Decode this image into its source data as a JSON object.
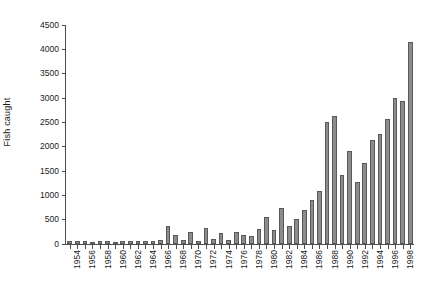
{
  "chart_data": {
    "type": "bar",
    "title": "",
    "xlabel": "",
    "ylabel": "Fish caught",
    "ylim": [
      0,
      4500
    ],
    "ytick_step": 500,
    "grid": false,
    "legend": null,
    "bar_color": "#8c8c8c",
    "bar_edge_color": "#595959",
    "axis_color": "#4d4d4d",
    "text_color": "#1a1a1a",
    "background": "#ffffff",
    "xtick_label_rotation": -90,
    "xtick_label_interval": 2,
    "yticks": [
      0,
      500,
      1000,
      1500,
      2000,
      2500,
      3000,
      3500,
      4000,
      4500
    ],
    "ytick_labels": [
      "0",
      "500",
      "1000",
      "1500",
      "2000",
      "2500",
      "3000",
      "3500",
      "4000",
      "4500"
    ],
    "categories": [
      "1954",
      "1955",
      "1956",
      "1957",
      "1958",
      "1959",
      "1960",
      "1961",
      "1962",
      "1963",
      "1964",
      "1965",
      "1966",
      "1967",
      "1968",
      "1969",
      "1970",
      "1971",
      "1972",
      "1973",
      "1974",
      "1975",
      "1976",
      "1977",
      "1978",
      "1979",
      "1980",
      "1981",
      "1982",
      "1983",
      "1984",
      "1985",
      "1986",
      "1987",
      "1988",
      "1989",
      "1990",
      "1991",
      "1992",
      "1993",
      "1994",
      "1995",
      "1996",
      "1997",
      "1998",
      "1999"
    ],
    "values": [
      60,
      55,
      60,
      50,
      55,
      60,
      50,
      55,
      60,
      55,
      60,
      70,
      90,
      380,
      180,
      90,
      240,
      70,
      330,
      110,
      230,
      80,
      250,
      180,
      170,
      300,
      560,
      290,
      740,
      380,
      520,
      700,
      900,
      1080,
      2500,
      2640,
      1410,
      1910,
      1270,
      1660,
      2130,
      2260,
      2560,
      3010,
      2940,
      4150
    ],
    "xtick_labels_shown": [
      "1954",
      "1956",
      "1958",
      "1960",
      "1962",
      "1964",
      "1966",
      "1968",
      "1970",
      "1972",
      "1974",
      "1976",
      "1978",
      "1980",
      "1982",
      "1984",
      "1986",
      "1988",
      "1990",
      "1992",
      "1994",
      "1996",
      "1998"
    ]
  }
}
